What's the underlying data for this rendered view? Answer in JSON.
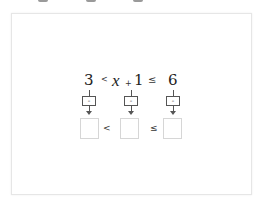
{
  "inequality": {
    "left_value": "3",
    "op1": "<",
    "variable": "x",
    "plus": "+",
    "constant": "1",
    "op2": "≤",
    "right_value": "6"
  },
  "operation_buttons": [
    {
      "label": "-",
      "icon": "minus-icon"
    },
    {
      "label": "-",
      "icon": "minus-icon"
    },
    {
      "label": "-",
      "icon": "minus-icon"
    }
  ],
  "answer_row": {
    "boxes": [
      "",
      "",
      ""
    ],
    "op1": "<",
    "op2": "≤"
  },
  "colors": {
    "text": "#222222",
    "border": "#555555",
    "answer_border": "#d6d6d6",
    "panel_border": "#e6e6e6"
  }
}
